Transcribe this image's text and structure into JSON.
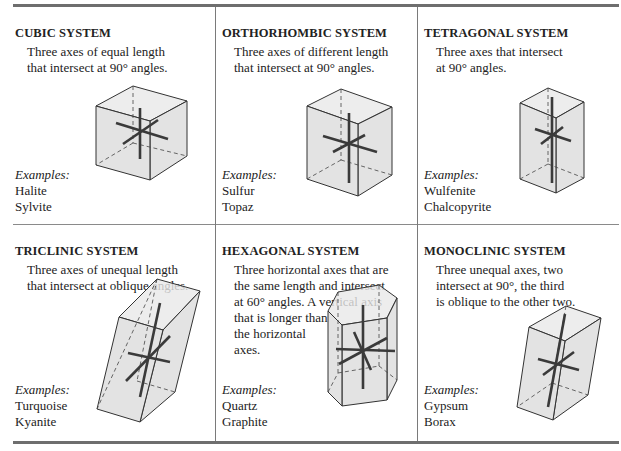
{
  "figure": {
    "examples_label": "Examples:",
    "cells": [
      {
        "id": "cubic",
        "title": "CUBIC SYSTEM",
        "description": "Three axes of equal length\nthat intersect at 90° angles.",
        "examples": [
          "Halite",
          "Sylvite"
        ]
      },
      {
        "id": "orthorhombic",
        "title": "ORTHORHOMBIC SYSTEM",
        "description": "Three axes of different length\nthat intersect at 90° angles.",
        "examples": [
          "Sulfur",
          "Topaz"
        ]
      },
      {
        "id": "tetragonal",
        "title": "TETRAGONAL SYSTEM",
        "description": "Three axes that intersect\nat 90° angles.",
        "examples": [
          "Wulfenite",
          "Chalcopyrite"
        ]
      },
      {
        "id": "triclinic",
        "title": "TRICLINIC SYSTEM",
        "description": "Three axes of unequal length\nthat intersect at oblique angles.",
        "examples": [
          "Turquoise",
          "Kyanite"
        ]
      },
      {
        "id": "hexagonal",
        "title": "HEXAGONAL SYSTEM",
        "description": "Three horizontal axes that are\nthe same length and intersect\nat 60° angles. A vertical axis\nthat is longer than\nthe horizontal\naxes.",
        "examples": [
          "Quartz",
          "Graphite"
        ]
      },
      {
        "id": "monoclinic",
        "title": "MONOCLINIC SYSTEM",
        "description": "Three unequal axes, two\nintersect at 90°, the third\nis oblique to the other two.",
        "examples": [
          "Gypsum",
          "Borax"
        ]
      }
    ]
  }
}
